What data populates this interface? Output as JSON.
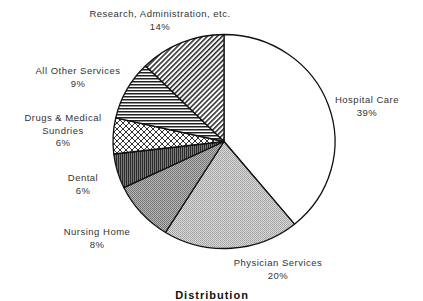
{
  "chart_data": {
    "type": "pie",
    "title": "Distribution",
    "start_angle_deg": 0,
    "direction": "clockwise",
    "center": [
      224,
      141.5
    ],
    "radius": [
      111,
      107
    ],
    "slices": [
      {
        "label": "Hospital Care",
        "value": 39,
        "value_label": "39%",
        "pattern": "white",
        "label_lines": [
          "Hospital Care",
          "39%"
        ],
        "label_pos": [
          367,
          103
        ]
      },
      {
        "label": "Physician Services",
        "value": 20,
        "value_label": "20%",
        "pattern": "light-gray",
        "label_lines": [
          "Physician Services",
          "20%"
        ],
        "label_pos": [
          278,
          266
        ]
      },
      {
        "label": "Nursing Home",
        "value": 8,
        "value_label": "8%",
        "pattern": "medium-gray",
        "label_lines": [
          "Nursing Home",
          "8%"
        ],
        "label_pos": [
          97,
          235
        ]
      },
      {
        "label": "Dental",
        "value": 6,
        "value_label": "6%",
        "pattern": "dark-stipple",
        "label_lines": [
          "Dental",
          "6%"
        ],
        "label_pos": [
          83,
          181
        ]
      },
      {
        "label": "Drugs & Medical Sundries",
        "value": 6,
        "value_label": "6%",
        "pattern": "crosshatch",
        "label_lines": [
          "Drugs & Medical",
          "Sundries",
          "6%"
        ],
        "label_pos": [
          63,
          121
        ]
      },
      {
        "label": "All Other Services",
        "value": 9,
        "value_label": "9%",
        "pattern": "horizontal-lines",
        "label_lines": [
          "All Other Services",
          "9%"
        ],
        "label_pos": [
          78,
          74
        ]
      },
      {
        "label": "Research, Administration, etc.",
        "value": 14,
        "value_label": "14%",
        "pattern": "diagonal-lines",
        "label_lines": [
          "Research, Administration, etc.",
          "14%"
        ],
        "label_pos": [
          160,
          17
        ]
      }
    ],
    "boundaries_deg": [
      0,
      140.6,
      211.8,
      244.5,
      263.3,
      282.7,
      315,
      360
    ],
    "legend": "none",
    "colors": {
      "outline": "#111111",
      "white": "#ffffff",
      "light-gray": "#c4c4c4",
      "medium-gray": "#9a9a9a",
      "dark": "#555555"
    }
  }
}
